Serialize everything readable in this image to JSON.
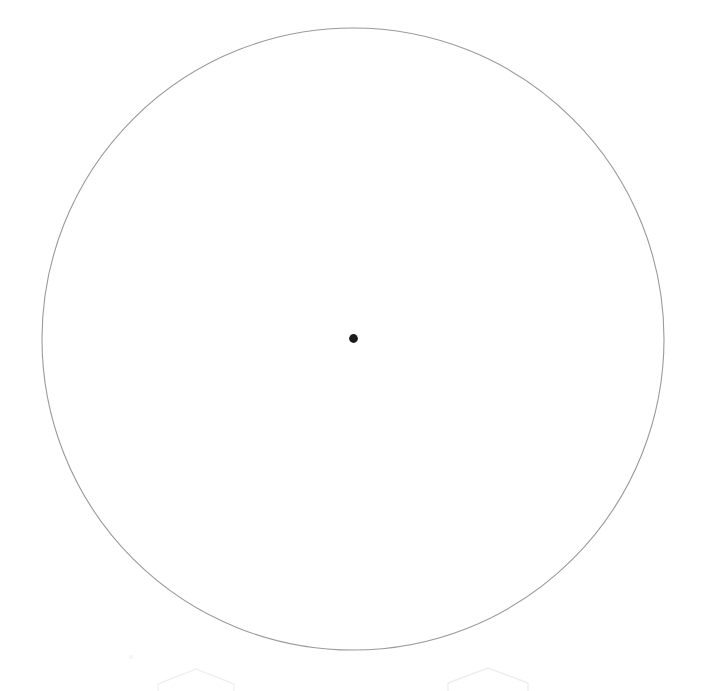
{
  "canvas": {
    "width": 703,
    "height": 691,
    "background_color": "#ffffff",
    "title": "Circle outline with center point"
  },
  "figure": {
    "description": "A large thin gray circle outline centered in the frame with a small solid black dot marking its center, and two very faint pentagon outlines along the bottom edge.",
    "circle": {
      "label": "circle-outline",
      "center_x": 353,
      "center_y": 339,
      "radius": 311,
      "diameter": 622,
      "stroke_color": "#9a9a9a",
      "stroke_width": 1.1,
      "fill": "none"
    },
    "center_point": {
      "label": "center-point",
      "center_x": 353.5,
      "center_y": 338.5,
      "radius": 4.4,
      "diameter": 9,
      "fill_color": "#1b1b1b"
    },
    "faint_markers": [
      {
        "label": "pentagon-left",
        "apex_x": 196,
        "apex_y": 669,
        "half_width": 38,
        "shoulder_y": 684,
        "base_y": 691,
        "stroke_color": "#f1f1f1",
        "stroke_width": 1.4
      },
      {
        "label": "pentagon-right",
        "apex_x": 488,
        "apex_y": 668,
        "half_width": 40,
        "shoulder_y": 683,
        "base_y": 691,
        "stroke_color": "#eeeeee",
        "stroke_width": 1.4
      }
    ],
    "speck": {
      "label": "faint-speck",
      "x": 131,
      "y": 657,
      "radius": 2.2,
      "fill_color": "#f6f6f6"
    }
  }
}
